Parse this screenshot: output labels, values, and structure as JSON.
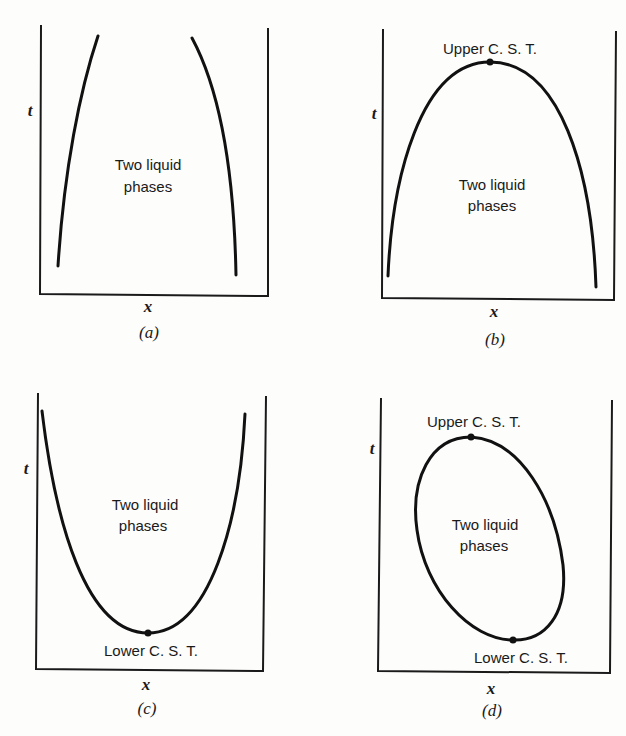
{
  "figure": {
    "panels": [
      {
        "id": "a",
        "caption": "(a)",
        "x_axis_label": "x",
        "y_axis_label": "t",
        "region_label_line1": "Two liquid",
        "region_label_line2": "phases",
        "critical_points": []
      },
      {
        "id": "b",
        "caption": "(b)",
        "x_axis_label": "x",
        "y_axis_label": "t",
        "region_label_line1": "Two liquid",
        "region_label_line2": "phases",
        "critical_points": [
          {
            "label": "Upper C. S. T."
          }
        ]
      },
      {
        "id": "c",
        "caption": "(c)",
        "x_axis_label": "x",
        "y_axis_label": "t",
        "region_label_line1": "Two liquid",
        "region_label_line2": "phases",
        "critical_points": [
          {
            "label": "Lower C. S. T."
          }
        ]
      },
      {
        "id": "d",
        "caption": "(d)",
        "x_axis_label": "x",
        "y_axis_label": "t",
        "region_label_line1": "Two liquid",
        "region_label_line2": "phases",
        "critical_points": [
          {
            "label": "Upper C. S. T."
          },
          {
            "label": "Lower C. S. T."
          }
        ]
      }
    ]
  }
}
